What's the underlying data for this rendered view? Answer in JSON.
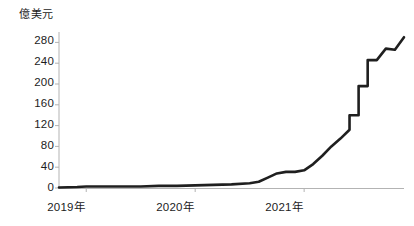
{
  "chart_data": {
    "type": "line",
    "title": "",
    "subtitle": "",
    "xlabel": "",
    "ylabel": "億美元",
    "unit_label": "億美元",
    "grid": false,
    "legend": null,
    "legend_position": "none",
    "line_color": "#1f1f1f",
    "axis_color": "#b3b3b3",
    "text_color": "#1c1c1c",
    "xlim": [
      "2018-10",
      "2021-12"
    ],
    "ylim": [
      0,
      300
    ],
    "yticks": [
      0,
      40,
      80,
      120,
      160,
      200,
      240,
      280
    ],
    "ytick_labels": [
      "0",
      "40",
      "80",
      "120",
      "160",
      "200",
      "240",
      "280"
    ],
    "xticks": [
      "2019年",
      "2020年",
      "2021年"
    ],
    "xtick_labels": [
      "2019年",
      "2020年",
      "2021年"
    ],
    "xtick_values": [
      "2019-01",
      "2020-01",
      "2021-01"
    ],
    "x": [
      "2018-10",
      "2018-12",
      "2019-01",
      "2019-03",
      "2019-05",
      "2019-07",
      "2019-09",
      "2019-11",
      "2020-01",
      "2020-03",
      "2020-05",
      "2020-07",
      "2020-08",
      "2020-09",
      "2020-10",
      "2020-11",
      "2020-12",
      "2021-01",
      "2021-02",
      "2021-03",
      "2021-04",
      "2021-05",
      "2021-06",
      "2021-07",
      "2021-08",
      "2021-09",
      "2021-10",
      "2021-11",
      "2021-12"
    ],
    "values": [
      1,
      2,
      3,
      3,
      3,
      3,
      4,
      4,
      5,
      6,
      7,
      9,
      12,
      20,
      28,
      31,
      31,
      34,
      46,
      62,
      80,
      95,
      112,
      140,
      196,
      246,
      268,
      266,
      290
    ],
    "annotations": [
      {
        "text": "sharp step increase",
        "at": "2021-07",
        "value": 140
      },
      {
        "text": "peak",
        "at": "2021-12",
        "value": 290
      }
    ]
  },
  "axes": {
    "y_unit": "億美元",
    "y_labels": [
      "280",
      "240",
      "200",
      "160",
      "120",
      "80",
      "40",
      "0"
    ],
    "x_labels": [
      "2019年",
      "2020年",
      "2021年"
    ]
  }
}
